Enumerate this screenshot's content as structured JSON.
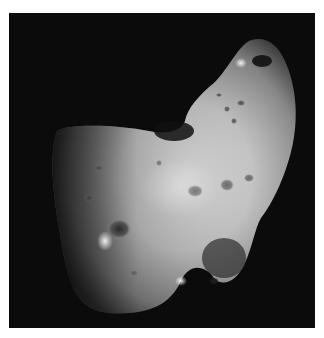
{
  "image": {
    "subject": "asteroid",
    "description": "Grayscale photograph of an elongated, cratered asteroid against a black space background, framed by a white border",
    "colors": {
      "background": "#ffffff",
      "space": "#0b0b0b",
      "surface_light": "#e6e6e6",
      "surface_shadow": "#3a3a3a"
    }
  }
}
